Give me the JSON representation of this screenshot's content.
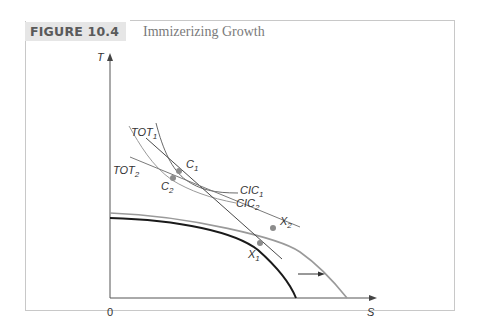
{
  "figure": {
    "number_label": "FIGURE 10.4",
    "title": "Immizerizing Growth"
  },
  "diagram": {
    "type": "economics-trade-diagram",
    "axes": {
      "y_label": "T",
      "x_label": "S",
      "origin_label": "0"
    },
    "curves": [
      {
        "name": "PPF1",
        "description": "original production possibilities frontier (dark)",
        "color": "#1a1a1a"
      },
      {
        "name": "PPF2",
        "description": "expanded production possibilities frontier after growth (gray)",
        "color": "#9a9a9a"
      },
      {
        "name": "CIC1",
        "label": "CIC",
        "subscript": "1",
        "color": "#6a6a6a"
      },
      {
        "name": "CIC2",
        "label": "CIC",
        "subscript": "2",
        "color": "#9a9a9a"
      },
      {
        "name": "TOT1",
        "label": "TOT",
        "subscript": "1",
        "color": "#4a4a4a"
      },
      {
        "name": "TOT2",
        "label": "TOT",
        "subscript": "2",
        "color": "#7a7a7a"
      }
    ],
    "points": [
      {
        "name": "C1",
        "label": "C",
        "subscript": "1"
      },
      {
        "name": "C2",
        "label": "C",
        "subscript": "2"
      },
      {
        "name": "X1",
        "label": "X",
        "subscript": "1"
      },
      {
        "name": "X2",
        "label": "X",
        "subscript": "2"
      }
    ],
    "arrow": {
      "direction": "right",
      "meaning": "outward shift of PPF"
    },
    "point_color": "#8c8c8c"
  }
}
